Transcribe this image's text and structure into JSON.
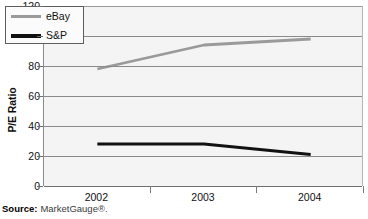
{
  "chart_data": {
    "type": "line",
    "title": "",
    "xlabel": "",
    "ylabel": "P/E Ratio",
    "categories": [
      "2002",
      "2003",
      "2004"
    ],
    "series": [
      {
        "name": "eBay",
        "values": [
          78,
          94,
          98
        ],
        "color": "#9a9a9a"
      },
      {
        "name": "S&P",
        "values": [
          28,
          28,
          21
        ],
        "color": "#111111"
      }
    ],
    "ylim": [
      0,
      120
    ],
    "yticks": [
      0,
      20,
      40,
      60,
      80,
      100,
      120
    ],
    "ytick_labels": [
      "0",
      "20",
      "40",
      "60",
      "80",
      "100",
      "120"
    ],
    "grid": true,
    "legend_position": "top-left",
    "legend_entries": [
      "eBay",
      "S&P"
    ]
  },
  "axis": {
    "y_title": "P/E Ratio"
  },
  "legend": {
    "items": [
      {
        "label": "eBay"
      },
      {
        "label": "S&P"
      }
    ]
  },
  "source": {
    "label": "Source:",
    "text": "MarketGauge®."
  }
}
